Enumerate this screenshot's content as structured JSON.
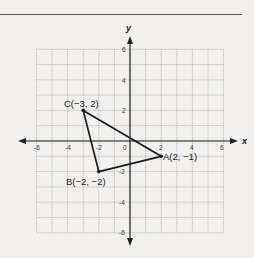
{
  "figure": {
    "x_axis_label": "x",
    "y_axis_label": "y",
    "x_ticks": [
      "-6",
      "-4",
      "-2",
      "0",
      "2",
      "4",
      "6"
    ],
    "y_ticks": [
      "6",
      "4",
      "2",
      "-2",
      "-4",
      "-6"
    ],
    "range": {
      "xmin": -6,
      "xmax": 6,
      "ymin": -6,
      "ymax": 6
    },
    "points": [
      {
        "name": "A",
        "label": "A(2, −1)",
        "x": 2,
        "y": -1
      },
      {
        "name": "B",
        "label": "B(−2, −2)",
        "x": -2,
        "y": -2
      },
      {
        "name": "C",
        "label": "C(−3, 2)",
        "x": -3,
        "y": 2
      }
    ],
    "shape": "triangle ABC",
    "colors": {
      "grid": "#9a9a9a",
      "axis": "#222222",
      "line": "#222222",
      "background": "#f1f0ee"
    }
  }
}
